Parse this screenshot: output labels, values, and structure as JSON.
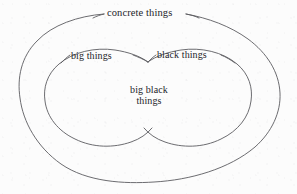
{
  "diagram": {
    "type": "euler-venn",
    "background_color": "#fcfcfc",
    "stroke_color": "#5b5b60",
    "text_color": "#24242a",
    "universe": {
      "name": "concrete-things",
      "label": "concrete things"
    },
    "sets": [
      {
        "name": "big-things",
        "label": "big things"
      },
      {
        "name": "black-things",
        "label": "black things"
      }
    ],
    "intersection": {
      "name": "big-black-things",
      "label_line_1": "big black",
      "label_line_2": "things",
      "label_full": "big black things"
    }
  }
}
